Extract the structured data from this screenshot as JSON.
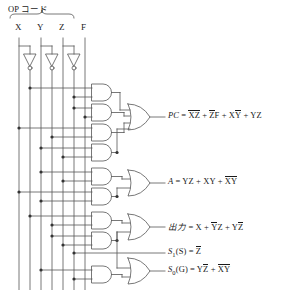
{
  "diagram": {
    "title": "OP コード",
    "type": "logic-gate-circuit"
  },
  "inputs": [
    {
      "name": "X",
      "x": 19
    },
    {
      "name": "Y",
      "x": 41
    },
    {
      "name": "Z",
      "x": 63
    },
    {
      "name": "F",
      "x": 85
    }
  ],
  "grouped_inputs": [
    "X",
    "Y",
    "Z"
  ],
  "inverters": [
    {
      "for": "X",
      "x": 30
    },
    {
      "for": "Y",
      "x": 52
    },
    {
      "for": "Z",
      "x": 74
    }
  ],
  "outputs": [
    {
      "id": "pc",
      "label": "PC",
      "terms": [
        {
          "parts": [
            {
              "t": "X",
              "bar": true
            },
            {
              "t": "Z",
              "bar": true
            }
          ]
        },
        {
          "parts": [
            {
              "t": "Z",
              "bar": true
            },
            {
              "t": "F",
              "bar": false
            }
          ]
        },
        {
          "parts": [
            {
              "t": "X",
              "bar": false
            },
            {
              "t": "Y",
              "bar": true
            }
          ]
        },
        {
          "parts": [
            {
              "t": "Y",
              "bar": false
            },
            {
              "t": "Z",
              "bar": false
            }
          ]
        }
      ],
      "text": "PC = XZ + ZF + XY + YZ"
    },
    {
      "id": "a",
      "label": "A",
      "terms": [
        {
          "parts": [
            {
              "t": "Y",
              "bar": false
            },
            {
              "t": "Z",
              "bar": false
            }
          ]
        },
        {
          "parts": [
            {
              "t": "X",
              "bar": false
            },
            {
              "t": "Y",
              "bar": false
            }
          ]
        },
        {
          "parts": [
            {
              "t": "X",
              "bar": true
            },
            {
              "t": "Y",
              "bar": true
            }
          ]
        }
      ],
      "text": "A = YZ + XY + XY"
    },
    {
      "id": "out",
      "label": "出力",
      "terms": [
        {
          "parts": [
            {
              "t": "X",
              "bar": false
            }
          ]
        },
        {
          "parts": [
            {
              "t": "Y",
              "bar": true
            },
            {
              "t": "Z",
              "bar": false
            }
          ]
        },
        {
          "parts": [
            {
              "t": "Y",
              "bar": false
            },
            {
              "t": "Z",
              "bar": true
            }
          ]
        }
      ],
      "text": "出力 = X + YZ + YZ"
    },
    {
      "id": "s1",
      "label": "S",
      "sub": "1",
      "paren": "(S)",
      "terms": [
        {
          "parts": [
            {
              "t": "Z",
              "bar": true
            }
          ]
        }
      ],
      "text": "S1(S) = Z"
    },
    {
      "id": "s0",
      "label": "S",
      "sub": "0",
      "paren": "(G)",
      "terms": [
        {
          "parts": [
            {
              "t": "Y",
              "bar": false
            },
            {
              "t": "Z",
              "bar": true
            }
          ]
        },
        {
          "parts": [
            {
              "t": "X",
              "bar": true
            },
            {
              "t": "Y",
              "bar": true
            }
          ]
        }
      ],
      "text": "S0(G) = YZ + XY"
    }
  ],
  "gates": {
    "and_count": 9,
    "or_count": 4,
    "not_count": 3
  },
  "colors": {
    "wire": "#555555",
    "text": "#1a1a1a",
    "background": "#ffffff"
  }
}
